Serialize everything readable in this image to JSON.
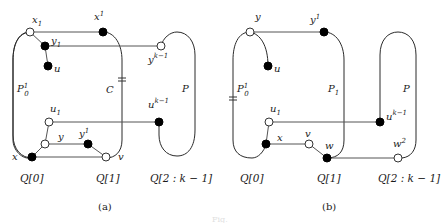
{
  "figure": {
    "caption_faint": "Fig.",
    "panels": [
      {
        "id": "a",
        "caption": "(a)",
        "column_labels": [
          "Q[0]",
          "Q[1]",
          "Q[2 : k − 1]"
        ],
        "path_labels": {
          "left": "P",
          "left_sub": "0",
          "left_sup": "1",
          "cycle": "C",
          "right": "P"
        },
        "vertices": {
          "x1": {
            "base": "x",
            "sub": "1",
            "style": "open"
          },
          "x1_1": {
            "base": "x",
            "sub": "1",
            "sup": "1",
            "style": "filled"
          },
          "y1": {
            "base": "y",
            "sub": "1",
            "style": "filled"
          },
          "u": {
            "base": "u",
            "style": "filled"
          },
          "y1_k": {
            "base": "y",
            "sub": "1",
            "sup": "k−1",
            "style": "open"
          },
          "u1": {
            "base": "u",
            "sub": "1",
            "style": "open"
          },
          "u1_k": {
            "base": "u",
            "sub": "1",
            "sup": "k−1",
            "style": "filled"
          },
          "y": {
            "base": "y",
            "style": "open"
          },
          "y1sup": {
            "base": "y",
            "sup": "1",
            "style": "filled"
          },
          "x": {
            "base": "x",
            "style": "filled"
          },
          "v": {
            "base": "v",
            "style": "open"
          }
        }
      },
      {
        "id": "b",
        "caption": "(b)",
        "column_labels": [
          "Q[0]",
          "Q[1]",
          "Q[2 : k − 1]"
        ],
        "path_labels": {
          "left": "P",
          "left_sub": "0",
          "left_sup": "1",
          "middle": "P",
          "middle_sub": "1",
          "right": "P"
        },
        "vertices": {
          "y": {
            "base": "y",
            "style": "open"
          },
          "y1sup": {
            "base": "y",
            "sup": "1",
            "style": "filled"
          },
          "u": {
            "base": "u",
            "style": "filled"
          },
          "u1": {
            "base": "u",
            "sub": "1",
            "style": "open"
          },
          "u1_k": {
            "base": "u",
            "sub": "1",
            "sup": "k−1",
            "style": "filled"
          },
          "x": {
            "base": "x",
            "style": "filled"
          },
          "v": {
            "base": "v",
            "style": "open"
          },
          "w": {
            "base": "w",
            "style": "filled"
          },
          "w2": {
            "base": "w",
            "sup": "2",
            "style": "open"
          }
        }
      }
    ]
  }
}
